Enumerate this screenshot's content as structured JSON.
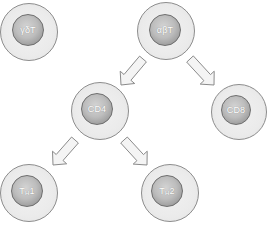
{
  "diagram": {
    "colors": {
      "cytoplasm": "#ebebeb",
      "cytoplasm_border": "#8c8c8c",
      "nucleus_light": "#d4d4d4",
      "nucleus_dark": "#878787",
      "nucleus_border": "#6e6e6e",
      "label": "#ffffff",
      "arrow_fill": "#f4f4f4",
      "arrow_stroke": "#8a8a8a"
    },
    "cells": [
      {
        "id": "gamma-delta-t",
        "label": "γδT",
        "label_main": "γδT",
        "label_sub": "",
        "label_tail": "",
        "cx": 29,
        "cy": 32,
        "r": 29,
        "nr": 16,
        "ndx": -1,
        "ndy": -2
      },
      {
        "id": "alpha-beta-t",
        "label": "αβT",
        "label_main": "αβT",
        "label_sub": "",
        "label_tail": "",
        "cx": 166,
        "cy": 31,
        "r": 29,
        "nr": 16,
        "ndx": -1,
        "ndy": -1
      },
      {
        "id": "cd4",
        "label": "CD4",
        "label_main": "CD4",
        "label_sub": "",
        "label_tail": "",
        "cx": 100,
        "cy": 111,
        "r": 29,
        "nr": 16,
        "ndx": -3,
        "ndy": -2
      },
      {
        "id": "cd8",
        "label": "CD8",
        "label_main": "CD8",
        "label_sub": "",
        "label_tail": "",
        "cx": 239,
        "cy": 112,
        "r": 28,
        "nr": 15,
        "ndx": -3,
        "ndy": -2
      },
      {
        "id": "th1",
        "label": "TH1",
        "label_main": "T",
        "label_sub": "H",
        "label_tail": "1",
        "cx": 29,
        "cy": 193,
        "r": 29,
        "nr": 16,
        "ndx": -2,
        "ndy": -2
      },
      {
        "id": "th2",
        "label": "TH2",
        "label_main": "T",
        "label_sub": "H",
        "label_tail": "2",
        "cx": 170,
        "cy": 193,
        "r": 29,
        "nr": 16,
        "ndx": -3,
        "ndy": -2
      }
    ],
    "arrows": [
      {
        "id": "alpha-beta-to-cd4",
        "from": "αβT",
        "to": "CD4",
        "x1": 143,
        "y1": 59,
        "x2": 121,
        "y2": 85
      },
      {
        "id": "alpha-beta-to-cd8",
        "from": "αβT",
        "to": "CD8",
        "x1": 190,
        "y1": 59,
        "x2": 214,
        "y2": 85
      },
      {
        "id": "cd4-to-th1",
        "from": "CD4",
        "to": "TH1",
        "x1": 75,
        "y1": 140,
        "x2": 53,
        "y2": 165
      },
      {
        "id": "cd4-to-th2",
        "from": "CD4",
        "to": "TH2",
        "x1": 124,
        "y1": 140,
        "x2": 147,
        "y2": 165
      }
    ]
  }
}
